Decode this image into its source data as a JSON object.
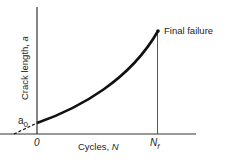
{
  "axes": {
    "y_label": "Crack length, a",
    "y_label_text": "Crack length, ",
    "y_label_var": "a",
    "x_label_text": "Cycles, ",
    "x_label_var": "N",
    "origin_label": "0",
    "a0_main": "a",
    "a0_sub": "0",
    "nf_main": "N",
    "nf_sub": "f"
  },
  "annotations": {
    "final_failure": "Final failure"
  },
  "colors": {
    "line": "#111111",
    "axis": "#333333",
    "text": "#222222"
  }
}
